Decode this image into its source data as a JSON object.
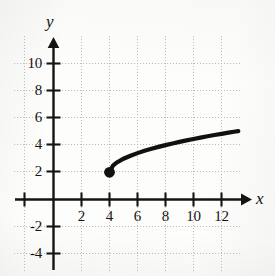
{
  "figure": {
    "kind": "cartesian-graph",
    "width": 275,
    "height": 276,
    "background_color": "#fdfdfc",
    "ink_color": "#141414",
    "grid_color": "#b9b9b9"
  },
  "axes": {
    "x_axis_label": "x",
    "y_axis_label": "y",
    "x_tick_labels": [
      "2",
      "4",
      "6",
      "8",
      "10",
      "12"
    ],
    "y_tick_labels": [
      "10",
      "8",
      "6",
      "4",
      "2",
      "-2",
      "-4"
    ]
  },
  "chart_data": {
    "type": "line",
    "title": "",
    "xlabel": "x",
    "ylabel": "y",
    "grid": true,
    "grid_spacing": 2,
    "legend": "none",
    "xlim": [
      -3,
      13.6
    ],
    "ylim": [
      -5,
      11.6
    ],
    "xticks": [
      2,
      4,
      6,
      8,
      10,
      12
    ],
    "yticks": [
      -4,
      -2,
      2,
      4,
      6,
      8,
      10
    ],
    "series": [
      {
        "name": "y = 2 + sqrt(x - 4)",
        "equation": "y = 2 + √(x − 4)",
        "domain": [
          4,
          13.2
        ],
        "range": [
          2,
          5.03
        ],
        "x": [
          4,
          4.25,
          4.5,
          5,
          5.5,
          6,
          6.5,
          7,
          7.5,
          8,
          8.5,
          9,
          9.5,
          10,
          10.5,
          11,
          11.5,
          12,
          12.5,
          13,
          13.2
        ],
        "values": [
          2,
          2.5,
          2.71,
          3,
          3.22,
          3.41,
          3.58,
          3.73,
          3.87,
          4,
          4.12,
          4.24,
          4.35,
          4.45,
          4.55,
          4.65,
          4.74,
          4.83,
          4.92,
          5,
          5.03
        ]
      }
    ],
    "points": [
      {
        "label": "endpoint",
        "x": 4,
        "y": 2,
        "marker": "filled-circle",
        "filled": true
      }
    ]
  }
}
